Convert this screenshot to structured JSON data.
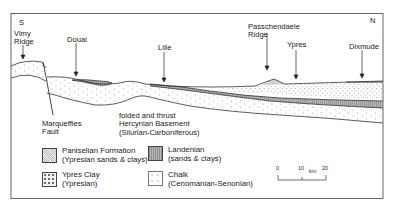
{
  "direction": {
    "south": "S",
    "north": "N"
  },
  "places": {
    "vimy": [
      "Vimy",
      "Ridge"
    ],
    "douai": "Douai",
    "lille": "Lille",
    "passchendaele": [
      "Passchendaele",
      "Ridge"
    ],
    "ypres": "Ypres",
    "dixmude": "Dixmude"
  },
  "annotations": {
    "fault": [
      "Marqueffies",
      "Fault"
    ],
    "basement": [
      "folded and thrust",
      "Hercynian Basement",
      "(Silurian-Carboniferous)"
    ]
  },
  "legend": [
    {
      "id": "paniselian",
      "name": "Paniselian Formation",
      "detail": "(Ypresian sands & clays)",
      "pattern": "stipple-dense"
    },
    {
      "id": "landenian",
      "name": "Landenian",
      "detail": "(sands & clays)",
      "pattern": "grey-vertical-hatch"
    },
    {
      "id": "ypres-clay",
      "name": "Ypres Clay",
      "detail": "(Ypresian)",
      "pattern": "cross-dots"
    },
    {
      "id": "chalk",
      "name": "Chalk",
      "detail": "(Cenomanian-Senonian)",
      "pattern": "sparse-dots"
    }
  ],
  "scale_bar": {
    "ticks": [
      "0",
      "10",
      "20"
    ],
    "unit": "km"
  },
  "colors": {
    "line": "#333333",
    "landenian_fill": "#a8a8a8",
    "background": "#ffffff"
  }
}
